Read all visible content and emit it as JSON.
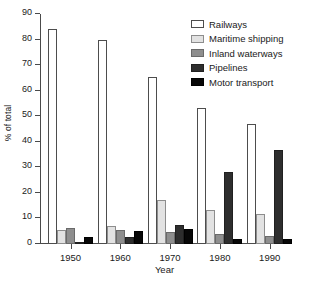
{
  "chart_data": {
    "type": "bar",
    "title": "",
    "xlabel": "Year",
    "ylabel": "% of total",
    "categories": [
      "1950",
      "1960",
      "1970",
      "1980",
      "1990"
    ],
    "ylim": [
      0,
      90
    ],
    "yticks": [
      0,
      10,
      20,
      30,
      40,
      50,
      60,
      70,
      80,
      90
    ],
    "grid": false,
    "legend_position": "top-right",
    "series": [
      {
        "name": "Railways",
        "color": "#ffffff",
        "values": [
          84.0,
          79.8,
          65.4,
          53.1,
          47.0
        ]
      },
      {
        "name": "Maritime shipping",
        "color": "#e2e2e2",
        "values": [
          5.5,
          7.1,
          17.3,
          13.2,
          11.9
        ]
      },
      {
        "name": "Inland waterways",
        "color": "#8e8e8e",
        "values": [
          6.2,
          5.4,
          4.8,
          3.8,
          3.2
        ]
      },
      {
        "name": "Pipelines",
        "color": "#2e2e2e",
        "values": [
          0.9,
          2.8,
          7.4,
          28.0,
          36.7
        ]
      },
      {
        "name": "Motor transport",
        "color": "#070707",
        "values": [
          2.8,
          5.1,
          5.8,
          2.1,
          1.9
        ]
      }
    ]
  }
}
